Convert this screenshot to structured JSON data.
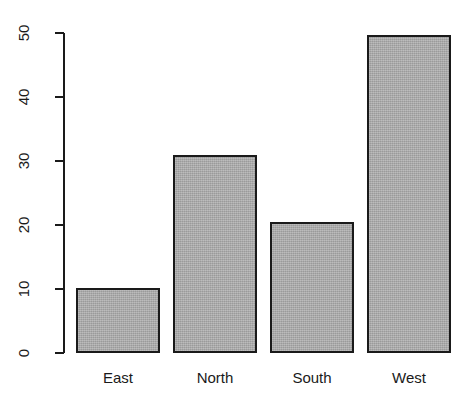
{
  "chart_data": {
    "type": "bar",
    "title": "",
    "xlabel": "",
    "ylabel": "",
    "categories": [
      "East",
      "North",
      "South",
      "West"
    ],
    "values": [
      10.1,
      30.9,
      20.5,
      49.7
    ],
    "ylim": [
      0,
      50
    ],
    "yticks": [
      0,
      10,
      20,
      30,
      40,
      50
    ],
    "ytick_labels": [
      "0",
      "10",
      "20",
      "30",
      "40",
      "50"
    ],
    "grid": false,
    "legend": false,
    "bar_fill_color": "#a9a9a9",
    "bar_border_color": "#1a1a1a",
    "axis_color": "#1a1a1a",
    "background_color": "#ffffff",
    "ytick_label_rotation": -90
  },
  "axis": {
    "y_tick_labels": [
      "0",
      "10",
      "20",
      "30",
      "40",
      "50"
    ]
  },
  "bars": [
    {
      "label": "East",
      "value": 10.1
    },
    {
      "label": "North",
      "value": 30.9
    },
    {
      "label": "South",
      "value": 20.5
    },
    {
      "label": "West",
      "value": 49.7
    }
  ]
}
